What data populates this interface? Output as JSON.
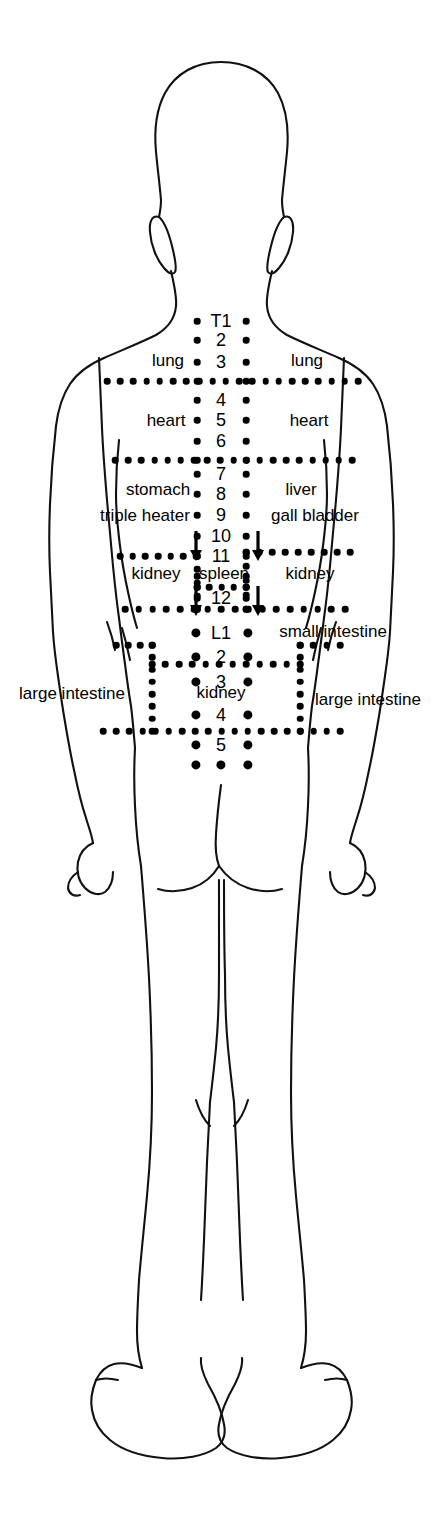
{
  "diagram": {
    "view": "posterior",
    "ink_color": "#000000",
    "background_color": "#ffffff",
    "dot_color": "#000000"
  },
  "spine": {
    "thoracic_prefix_label": "T1",
    "lumbar_prefix_label": "L1",
    "thoracic_numbers": [
      "T1",
      "2",
      "3",
      "4",
      "5",
      "6",
      "7",
      "8",
      "9",
      "10",
      "11",
      "12"
    ],
    "lumbar_numbers": [
      "L1",
      "2",
      "3",
      "4",
      "5"
    ],
    "levels": [
      {
        "id": "T1",
        "label": "T1",
        "x": 221,
        "y": 321,
        "dot_r": 3.3
      },
      {
        "id": "T2",
        "label": "2",
        "x": 221,
        "y": 340,
        "dot_r": 3.3
      },
      {
        "id": "T3",
        "label": "3",
        "x": 221,
        "y": 362,
        "dot_r": 3.3
      },
      {
        "id": "T4",
        "label": "4",
        "x": 221,
        "y": 400,
        "dot_r": 3.3
      },
      {
        "id": "T5",
        "label": "5",
        "x": 221,
        "y": 420,
        "dot_r": 3.3
      },
      {
        "id": "T6",
        "label": "6",
        "x": 221,
        "y": 441,
        "dot_r": 3.3
      },
      {
        "id": "T7",
        "label": "7",
        "x": 221,
        "y": 474,
        "dot_r": 3.3
      },
      {
        "id": "T8",
        "label": "8",
        "x": 221,
        "y": 494,
        "dot_r": 3.3
      },
      {
        "id": "T9",
        "label": "9",
        "x": 221,
        "y": 515,
        "dot_r": 3.3
      },
      {
        "id": "T10",
        "label": "10",
        "x": 221,
        "y": 536,
        "dot_r": 3.3
      },
      {
        "id": "T11",
        "label": "11",
        "x": 221,
        "y": 556,
        "dot_r": 3.3
      },
      {
        "id": "T12",
        "label": "12",
        "x": 221,
        "y": 598,
        "dot_r": 3.3
      },
      {
        "id": "L1",
        "label": "L1",
        "x": 221,
        "y": 633,
        "dot_r": 4.6
      },
      {
        "id": "L2",
        "label": "2",
        "x": 221,
        "y": 657,
        "dot_r": 4.6
      },
      {
        "id": "L3",
        "label": "3",
        "x": 221,
        "y": 682,
        "dot_r": 4.6
      },
      {
        "id": "L4",
        "label": "4",
        "x": 221,
        "y": 715,
        "dot_r": 4.6
      },
      {
        "id": "L5",
        "label": "5",
        "x": 221,
        "y": 745,
        "dot_r": 4.6
      }
    ]
  },
  "organ_labels": [
    {
      "id": "lung-left",
      "text": "lung",
      "x": 168,
      "y": 360,
      "side": "left"
    },
    {
      "id": "lung-right",
      "text": "lung",
      "x": 307,
      "y": 360,
      "side": "right"
    },
    {
      "id": "heart-left",
      "text": "heart",
      "x": 166,
      "y": 420,
      "side": "left"
    },
    {
      "id": "heart-right",
      "text": "heart",
      "x": 309,
      "y": 420,
      "side": "right"
    },
    {
      "id": "stomach",
      "text": "stomach",
      "x": 158,
      "y": 489,
      "side": "left"
    },
    {
      "id": "triple-heater",
      "text": "triple heater",
      "x": 145,
      "y": 515,
      "side": "left"
    },
    {
      "id": "liver",
      "text": "liver",
      "x": 301,
      "y": 489,
      "side": "right"
    },
    {
      "id": "gall-bladder",
      "text": "gall bladder",
      "x": 315,
      "y": 515,
      "side": "right"
    },
    {
      "id": "kidney-left-upper",
      "text": "kidney",
      "x": 156,
      "y": 573,
      "side": "left"
    },
    {
      "id": "spleen",
      "text": "spleen",
      "x": 224,
      "y": 573,
      "side": "center"
    },
    {
      "id": "kidney-right-upper",
      "text": "kidney",
      "x": 310,
      "y": 573,
      "side": "right"
    },
    {
      "id": "small-intestine",
      "text": "small intestine",
      "x": 333,
      "y": 631,
      "side": "right"
    },
    {
      "id": "kidney-lower",
      "text": "kidney",
      "x": 221,
      "y": 692,
      "side": "center"
    },
    {
      "id": "large-intestine-left",
      "text": "large intestine",
      "x": 72,
      "y": 693,
      "side": "left"
    },
    {
      "id": "large-intestine-right",
      "text": "large intestine",
      "x": 368,
      "y": 699,
      "side": "right"
    }
  ],
  "arrows": [
    {
      "id": "arrow-t10-left",
      "x": 196,
      "y": 531,
      "length": 30
    },
    {
      "id": "arrow-t10-right",
      "x": 258,
      "y": 531,
      "length": 30
    },
    {
      "id": "arrow-t12-left",
      "x": 196,
      "y": 586,
      "length": 30
    },
    {
      "id": "arrow-t12-right",
      "x": 258,
      "y": 586,
      "length": 30
    }
  ],
  "zones": [
    {
      "id": "zone-lung",
      "organs": [
        "lung"
      ],
      "levels": [
        "T1",
        "2",
        "3"
      ]
    },
    {
      "id": "zone-heart",
      "organs": [
        "heart"
      ],
      "levels": [
        "4",
        "5",
        "6"
      ]
    },
    {
      "id": "zone-stomach-liver",
      "organs": [
        "stomach",
        "triple heater",
        "liver",
        "gall bladder"
      ],
      "levels": [
        "7",
        "8",
        "9",
        "10",
        "11"
      ]
    },
    {
      "id": "zone-kidney-spleen",
      "organs": [
        "kidney",
        "spleen"
      ],
      "levels": [
        "11",
        "12"
      ]
    },
    {
      "id": "zone-small-intestine",
      "organs": [
        "small intestine"
      ],
      "levels": [
        "L1",
        "2"
      ]
    },
    {
      "id": "zone-kidney-lower",
      "organs": [
        "kidney"
      ],
      "levels": [
        "3",
        "4"
      ]
    },
    {
      "id": "zone-large-intestine",
      "organs": [
        "large intestine"
      ],
      "levels": [
        "2",
        "3",
        "4"
      ]
    }
  ]
}
